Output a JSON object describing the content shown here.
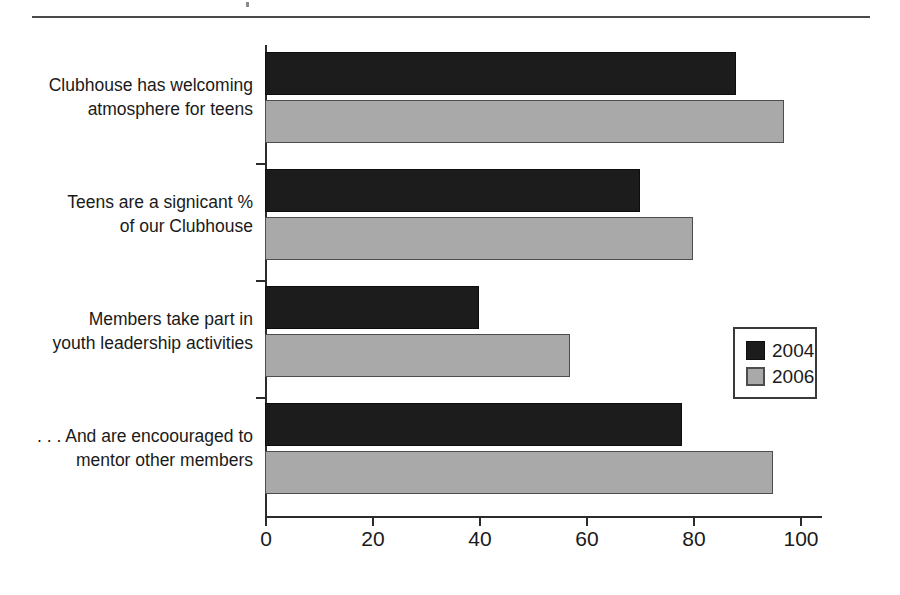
{
  "chart_data": {
    "type": "bar",
    "orientation": "horizontal",
    "title": "",
    "subtitle": "",
    "xlabel": "",
    "ylabel": "",
    "xlim": [
      0,
      100
    ],
    "xticks": [
      0,
      20,
      40,
      60,
      80,
      100
    ],
    "xticklabels": [
      "0",
      "20",
      "40",
      "60",
      "80",
      "100"
    ],
    "grid": false,
    "legend_position": "center-right",
    "categories": [
      "Clubhouse has welcoming atmosphere for teens",
      "Teens are a signicant % of our Clubhouse",
      "Members take part in youth leadership activities",
      ". . . And are encoouraged to mentor other members"
    ],
    "category_lines": [
      [
        "Clubhouse has welcoming",
        "atmosphere for teens"
      ],
      [
        "Teens are a signicant %",
        "of our Clubhouse"
      ],
      [
        "Members take part in",
        "youth leadership activities"
      ],
      [
        ". . . And are encoouraged to",
        "mentor other members"
      ]
    ],
    "series": [
      {
        "name": "2004",
        "color": "#1c1c1c",
        "values": [
          88,
          70,
          40,
          78
        ]
      },
      {
        "name": "2006",
        "color": "#a9a9a9",
        "values": [
          97,
          80,
          57,
          95
        ]
      }
    ]
  },
  "legend": {
    "entries": [
      {
        "label": "2004",
        "swatch": "series-2004-swatch"
      },
      {
        "label": "2006",
        "swatch": "series-2006-swatch"
      }
    ]
  },
  "colors": {
    "series_2004": "#1c1c1c",
    "series_2006": "#a9a9a9",
    "axis": "#2b2b2b",
    "rule": "#4a4a4a",
    "text": "#1a1a1a",
    "background": "#ffffff"
  }
}
